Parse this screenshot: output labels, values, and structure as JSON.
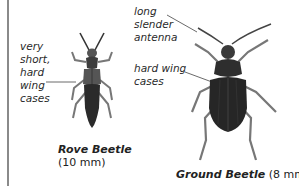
{
  "diagram": {
    "type": "labelled-illustration",
    "specimens": [
      {
        "name": "Rove Beetle",
        "size": "(10 mm)",
        "annotations": [
          {
            "lines": [
              "very",
              "short,",
              "hard",
              "wing",
              "cases"
            ]
          }
        ]
      },
      {
        "name": "Ground Beetle",
        "size": "(8 mm)",
        "annotations": [
          {
            "lines": [
              "long",
              "slender",
              "antenna"
            ]
          },
          {
            "lines": [
              "hard wing",
              "cases"
            ]
          }
        ]
      }
    ],
    "colors": {
      "border": "#8a8a8a",
      "beetle_dark": "#2b2b2b",
      "beetle_mid": "#5a5a5a",
      "leg": "#777777",
      "text": "#222222"
    }
  }
}
